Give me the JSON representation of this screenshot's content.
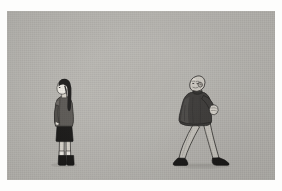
{
  "artwork": {
    "title": "Girl and Walking Man",
    "medium": "digital illustration",
    "caption": "A girl with long dark hair stands in profile at left while a bald man in a dark jacket walks to the right, glancing back over his shoulder."
  },
  "canvas": {
    "width": 282,
    "height": 191,
    "border_color": "#fdfdfc",
    "background_color": "#b8b6b1",
    "image_area": {
      "x": 7,
      "y": 11,
      "width": 268,
      "height": 169
    }
  },
  "palette": {
    "background": "#b8b6b1",
    "paper_white": "#fdfdfc",
    "hair_dark": "#1c1a1a",
    "coat_dark": "#3a3836",
    "coat_mid": "#55524e",
    "skirt_black": "#171615",
    "skin_light": "#efece5",
    "trouser_light": "#c9c6bf",
    "shoe_black": "#171615",
    "outline": "#242220",
    "shadow": "#9b9994"
  },
  "figures": [
    {
      "id": "girl",
      "data_name": "figure-girl",
      "label": "Girl standing in profile",
      "position": {
        "x": 46,
        "y": 76,
        "width": 36,
        "height": 88
      },
      "facing": "left",
      "pose": "standing",
      "parts": [
        {
          "name": "head",
          "label": "Head in profile"
        },
        {
          "name": "hair",
          "label": "Long dark hair",
          "color": "#1c1a1a"
        },
        {
          "name": "face",
          "label": "Pale face",
          "color": "#efece5"
        },
        {
          "name": "jacket",
          "label": "Grey jacket",
          "color": "#55524e"
        },
        {
          "name": "skirt",
          "label": "Black skirt",
          "color": "#171615"
        },
        {
          "name": "legs",
          "label": "Bare legs",
          "color": "#d6d2ca"
        },
        {
          "name": "boots",
          "label": "Dark boots",
          "color": "#171615"
        }
      ]
    },
    {
      "id": "man",
      "data_name": "figure-man",
      "label": "Man walking and looking back",
      "position": {
        "x": 168,
        "y": 76,
        "width": 62,
        "height": 90
      },
      "facing": "right",
      "pose": "walking, head turned back",
      "parts": [
        {
          "name": "head",
          "label": "Bald head turned back"
        },
        {
          "name": "jacket",
          "label": "Dark jacket",
          "color": "#3a3836"
        },
        {
          "name": "arm",
          "label": "Raised bent arm"
        },
        {
          "name": "trousers",
          "label": "Light trousers",
          "color": "#c9c6bf"
        },
        {
          "name": "shoes",
          "label": "Dark shoes",
          "color": "#171615"
        },
        {
          "name": "ground_shadow",
          "label": "Ground shadow",
          "color": "#9b9994"
        }
      ]
    }
  ]
}
